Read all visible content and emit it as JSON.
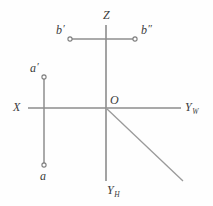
{
  "diagram": {
    "background_color": "#fefefe",
    "line_color": "#8c8c8c",
    "label_color": "#3b3b3b",
    "labels": {
      "z_axis": "Z",
      "x_axis": "X",
      "yw_axis_letter": "Y",
      "yw_axis_subscript": "W",
      "yh_axis_letter": "Y",
      "yh_axis_subscript": "H",
      "origin": "O",
      "point_b_front": "b",
      "point_b_front_prime": "′",
      "point_b_side": "b",
      "point_b_side_prime": "″",
      "point_a_front": "a",
      "point_a_front_prime": "′",
      "point_a_top": "a"
    },
    "geometry": {
      "origin": {
        "x": 106,
        "y": 108
      },
      "z_axis": {
        "x1": 106,
        "y1": 25,
        "x2": 106,
        "y2": 108
      },
      "yh_axis": {
        "x1": 106,
        "y1": 108,
        "x2": 106,
        "y2": 181
      },
      "x_axis": {
        "x1": 28,
        "y1": 108,
        "x2": 106,
        "y2": 108
      },
      "yw_axis": {
        "x1": 106,
        "y1": 108,
        "x2": 181,
        "y2": 108
      },
      "diagonal_ray": {
        "x1": 106,
        "y1": 108,
        "x2": 183,
        "y2": 181
      },
      "segment_b": {
        "x1": 70,
        "y1": 39,
        "x2": 135,
        "y2": 39
      },
      "segment_a": {
        "x1": 44,
        "y1": 77,
        "x2": 44,
        "y2": 165
      },
      "markers": [
        {
          "name": "b-front",
          "x": 70,
          "y": 39,
          "r": 2.1
        },
        {
          "name": "b-side",
          "x": 135,
          "y": 39,
          "r": 2.1
        },
        {
          "name": "a-front",
          "x": 44,
          "y": 77,
          "r": 2.1
        },
        {
          "name": "a-top",
          "x": 44,
          "y": 165,
          "r": 2.1
        }
      ]
    }
  }
}
